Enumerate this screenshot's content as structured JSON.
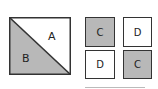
{
  "diagram": {
    "large_square": {
      "regions": [
        {
          "label": "A",
          "fill": "#ffffff",
          "position": "upper-right triangle"
        },
        {
          "label": "B",
          "fill": "#b8b8b8",
          "position": "lower-left triangle"
        }
      ]
    },
    "small_squares": [
      {
        "label": "C",
        "fill": "#b8b8b8",
        "row": 1,
        "col": 1
      },
      {
        "label": "D",
        "fill": "#ffffff",
        "row": 1,
        "col": 2
      },
      {
        "label": "D",
        "fill": "#ffffff",
        "row": 2,
        "col": 1
      },
      {
        "label": "C",
        "fill": "#b8b8b8",
        "row": 2,
        "col": 2
      }
    ],
    "colors": {
      "shaded": "#b8b8b8",
      "border": "#333333",
      "background": "#ffffff"
    }
  }
}
